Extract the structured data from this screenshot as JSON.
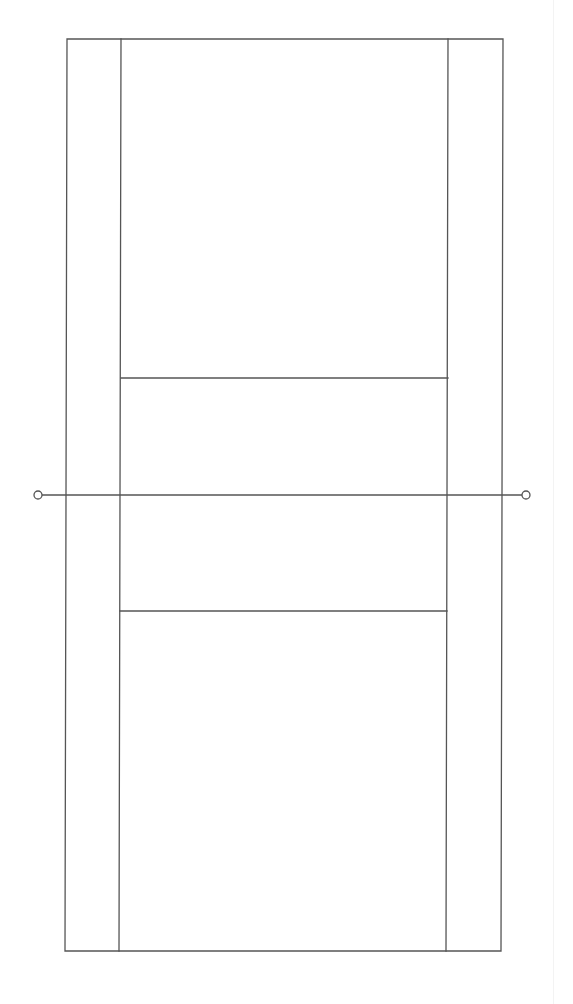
{
  "diagram": {
    "type": "tennis-court",
    "orientation": "vertical",
    "line_color": "#555555",
    "background": "#ffffff",
    "outer_court": {
      "top_left": [
        67,
        39
      ],
      "top_right": [
        503,
        39
      ],
      "bottom_left": [
        65,
        951
      ],
      "bottom_right": [
        501,
        951
      ]
    },
    "singles_sidelines": {
      "left": {
        "top": [
          121,
          39
        ],
        "bottom": [
          119,
          951
        ]
      },
      "right": {
        "top": [
          448,
          39
        ],
        "bottom": [
          446,
          951
        ]
      }
    },
    "service_lines": [
      {
        "name": "top-service-line",
        "left": [
          121,
          378
        ],
        "right": [
          448,
          378
        ]
      },
      {
        "name": "bottom-service-line",
        "left": [
          120,
          611
        ],
        "right": [
          447,
          611
        ]
      }
    ],
    "net": {
      "y": 495,
      "left_x": 42,
      "right_x": 522,
      "posts": [
        {
          "name": "left-net-post",
          "cx": 38,
          "cy": 495,
          "r": 4
        },
        {
          "name": "right-net-post",
          "cx": 526,
          "cy": 495,
          "r": 4
        }
      ]
    }
  }
}
